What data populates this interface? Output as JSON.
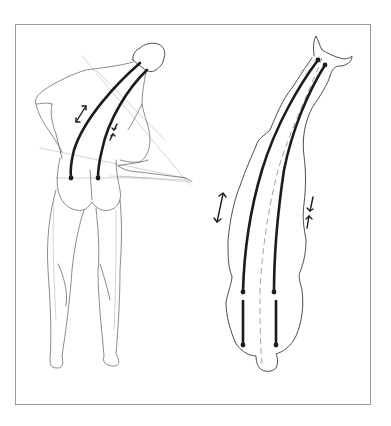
{
  "figure": {
    "colors": {
      "background": "#ffffff",
      "frame": "#9a9a9a",
      "lines": "#1c1c1c",
      "sketch": "#5a5a5a"
    },
    "panels": [
      {
        "id": "human",
        "subject": "human-back-view",
        "markers": {
          "spine_lines": 2,
          "end_dots": 2,
          "double_arrow": "stretch-side",
          "converging_arrows": "compression-side"
        }
      },
      {
        "id": "horse",
        "subject": "horse-top-view",
        "markers": {
          "spine_lines": 2,
          "lower_segments": 2,
          "end_dots": 6,
          "center_line": "dashed",
          "double_arrow": "stretch-side",
          "converging_arrows": "compression-side"
        }
      }
    ]
  }
}
